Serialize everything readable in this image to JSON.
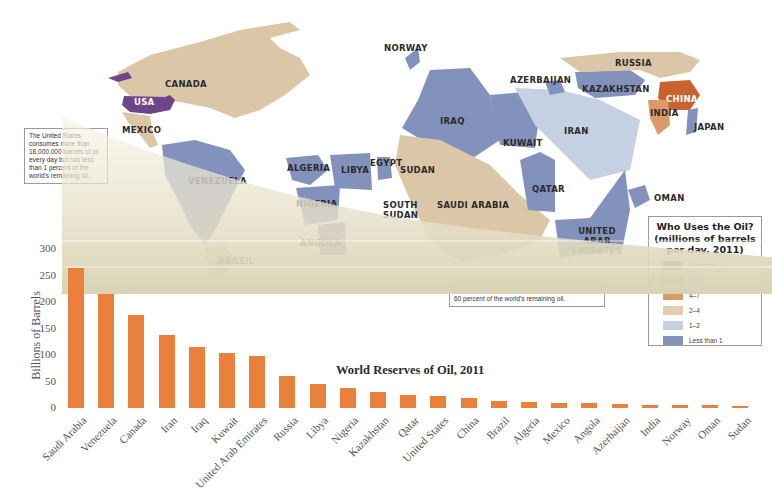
{
  "map": {
    "country_labels": {
      "canada": "CANADA",
      "usa": "USA",
      "mexico": "MEXICO",
      "venezuela": "VENEZUELA",
      "brazil": "BRAZIL",
      "norway": "NORWAY",
      "algeria": "ALGERIA",
      "libya": "LIBYA",
      "egypt": "EGYPT",
      "sudan": "SUDAN",
      "south_sudan": "SOUTH SUDAN",
      "nigeria": "NIGERIA",
      "angola": "ANGOLA",
      "iraq": "IRAQ",
      "kuwait": "KUWAIT",
      "saudi_arabia": "SAUDI ARABIA",
      "qatar": "QATAR",
      "united_arab_emirates": "UNITED ARAB EMIRATES",
      "oman": "OMAN",
      "iran": "IRAN",
      "azerbaijan": "AZERBAIJAN",
      "kazakhstan": "KAZAKHSTAN",
      "russia": "RUSSIA",
      "china": "CHINA",
      "india": "INDIA",
      "japan": "JAPAN"
    },
    "notes": {
      "usa_note": "The United States consumes more than 18,000,000 barrels of oil every day but has less than 1 percent of the world's remaining oil.",
      "mideast_note": "North Africa and Southwest Asia control more than 60 percent of the world's remaining oil."
    },
    "legend": {
      "title": "Who Uses the Oil? (millions of barrels per day, 2011)",
      "items": [
        {
          "label": "More than 10",
          "color": "#7b4a8c"
        },
        {
          "label": "7–10",
          "color": "#c9622e"
        },
        {
          "label": "4–7",
          "color": "#dc9a6a"
        },
        {
          "label": "2–4",
          "color": "#e2cdb0"
        },
        {
          "label": "1–2",
          "color": "#c5d0e3"
        },
        {
          "label": "Less than 1",
          "color": "#8391bd"
        }
      ]
    }
  },
  "chart_data": {
    "type": "bar",
    "title": "World Reserves of Oil, 2011",
    "xlabel": "",
    "ylabel": "Billions of Barrels",
    "ylim": [
      0,
      300
    ],
    "yticks": [
      0,
      50,
      100,
      150,
      200,
      250,
      300
    ],
    "grid": true,
    "bar_color": "#e9803c",
    "categories": [
      "Saudi Arabia",
      "Venezuela",
      "Canada",
      "Iran",
      "Iraq",
      "Kuwait",
      "United Arab Emirates",
      "Russia",
      "Libya",
      "Nigeria",
      "Kazakhstan",
      "Qatar",
      "United States",
      "China",
      "Brazil",
      "Algeria",
      "Mexico",
      "Angola",
      "Azerbaijan",
      "India",
      "Norway",
      "Oman",
      "Sudan"
    ],
    "values": [
      265,
      215,
      175,
      137,
      115,
      104,
      98,
      60,
      46,
      37,
      30,
      25,
      23,
      19,
      13,
      12,
      10,
      9,
      7,
      6,
      6,
      5,
      4
    ]
  }
}
